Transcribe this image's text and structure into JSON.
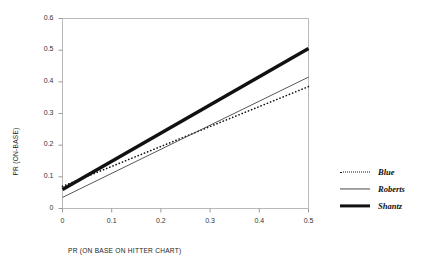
{
  "chart_data": {
    "type": "line",
    "title": "",
    "xlabel": "PR (ON BASE ON HITTER CHART)",
    "ylabel": "PR (ON-BASE)",
    "xlim": [
      0,
      0.5
    ],
    "ylim": [
      0,
      0.6
    ],
    "xticks": [
      "0",
      "0.1",
      "0.2",
      "0.3",
      "0.4",
      "0.5"
    ],
    "yticks": [
      "0",
      "0.1",
      "0.2",
      "0.3",
      "0.4",
      "0.5",
      "0.6"
    ],
    "xtick_values": [
      0,
      0.1,
      0.2,
      0.3,
      0.4,
      0.5
    ],
    "ytick_values": [
      0,
      0.1,
      0.2,
      0.3,
      0.4,
      0.5,
      0.6
    ],
    "grid": false,
    "legend_position": "right",
    "x": [
      0,
      0.5
    ],
    "series": [
      {
        "name": "Blue",
        "values": [
          0.07,
          0.385
        ],
        "style": "dotted",
        "color": "#111111",
        "width": 1.6
      },
      {
        "name": "Roberts",
        "values": [
          0.035,
          0.415
        ],
        "style": "solid-thin",
        "color": "#444444",
        "width": 0.9
      },
      {
        "name": "Shantz",
        "values": [
          0.06,
          0.505
        ],
        "style": "solid-thick",
        "color": "#111111",
        "width": 3.4
      }
    ]
  },
  "legend": {
    "items": [
      {
        "label": "Blue"
      },
      {
        "label": "Roberts"
      },
      {
        "label": "Shantz"
      }
    ]
  },
  "axes": {
    "frame_color": "#b9b9b9",
    "tick_color": "#9a9a9a"
  }
}
